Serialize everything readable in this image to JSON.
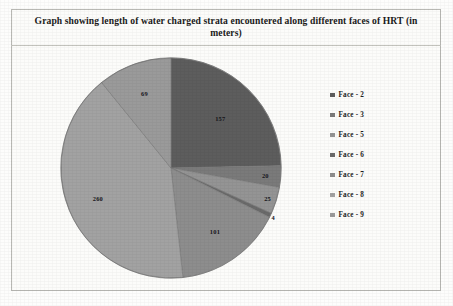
{
  "figure": {
    "title": "Graph showing length of water charged strata encountered along different faces of HRT (in meters)"
  },
  "legend": {
    "items": [
      {
        "label": "Face - 2",
        "color": "#5d5d5d"
      },
      {
        "label": "Face - 3",
        "color": "#7a7a7a"
      },
      {
        "label": "Face - 5",
        "color": "#949494"
      },
      {
        "label": "Face - 6",
        "color": "#6a6a6a"
      },
      {
        "label": "Face - 7",
        "color": "#8d8d8d"
      },
      {
        "label": "Face - 8",
        "color": "#a2a2a2"
      },
      {
        "label": "Face - 9",
        "color": "#9a9a9a"
      }
    ]
  },
  "chart_data": {
    "type": "pie",
    "title": "Graph showing length of water charged strata encountered along different faces of HRT (in meters)",
    "xlabel": "",
    "ylabel": "",
    "unit": "meters",
    "legend_position": "right",
    "grid": false,
    "total": 636,
    "categories": [
      "Face - 2",
      "Face - 3",
      "Face - 5",
      "Face - 6",
      "Face - 7",
      "Face - 8",
      "Face - 9"
    ],
    "values": [
      157,
      20,
      25,
      4,
      101,
      260,
      69
    ],
    "colors": [
      "#5d5d5d",
      "#7a7a7a",
      "#949494",
      "#6a6a6a",
      "#8d8d8d",
      "#a2a2a2",
      "#9a9a9a"
    ],
    "data_labels": [
      "157",
      "20",
      "25",
      "4",
      "101",
      "260",
      "69"
    ],
    "slices": [
      {
        "name": "Face - 2",
        "value": 157,
        "label": "157",
        "color": "#5d5d5d"
      },
      {
        "name": "Face - 3",
        "value": 20,
        "label": "20",
        "color": "#7a7a7a"
      },
      {
        "name": "Face - 5",
        "value": 25,
        "label": "25",
        "color": "#949494"
      },
      {
        "name": "Face - 6",
        "value": 4,
        "label": "4",
        "color": "#6a6a6a"
      },
      {
        "name": "Face - 7",
        "value": 101,
        "label": "101",
        "color": "#8d8d8d"
      },
      {
        "name": "Face - 8",
        "value": 260,
        "label": "260",
        "color": "#a2a2a2"
      },
      {
        "name": "Face - 9",
        "value": 69,
        "label": "69",
        "color": "#9a9a9a"
      }
    ]
  }
}
